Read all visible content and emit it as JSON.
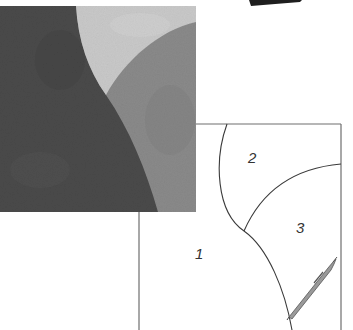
{
  "figure": {
    "photo": {
      "regions": [
        {
          "name": "dark-fabric",
          "color": "#4a4a4a"
        },
        {
          "name": "light-fabric",
          "color": "#c9c9c9"
        },
        {
          "name": "medium-fabric",
          "color": "#8a8a8a"
        }
      ]
    },
    "diagram": {
      "line_color": "#3a3a3a",
      "frame_color": "#6e6e6e",
      "labels": [
        {
          "id": "piece-1",
          "text": "1"
        },
        {
          "id": "piece-2",
          "text": "2"
        },
        {
          "id": "piece-3",
          "text": "3"
        }
      ]
    },
    "pen": {
      "body_color": "#9a9a9a",
      "outline_color": "#555555"
    },
    "top_wedge": {
      "color": "#1e1e1e"
    }
  }
}
